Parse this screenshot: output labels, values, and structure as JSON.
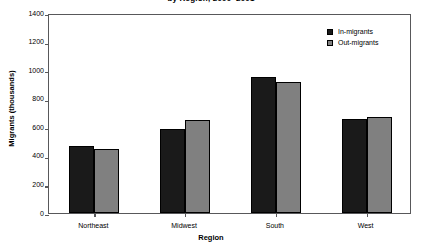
{
  "chart_data": {
    "type": "bar",
    "title": "by Region, 2000–2001",
    "xlabel": "Region",
    "ylabel": "Migrants (thousands)",
    "categories": [
      "Northeast",
      "Midwest",
      "South",
      "West"
    ],
    "series": [
      {
        "name": "In-migrants",
        "color": "#1a1a1a",
        "values": [
          470,
          590,
          950,
          660
        ]
      },
      {
        "name": "Out-migrants",
        "color": "#808080",
        "values": [
          450,
          650,
          915,
          675
        ]
      }
    ],
    "ylim": [
      0,
      1400
    ],
    "ytick_step": 200,
    "yticks": [
      0,
      200,
      400,
      600,
      800,
      1000,
      1200,
      1400
    ],
    "ytick_labels": [
      "0",
      "200",
      "400",
      "600",
      "800",
      "1000",
      "1200",
      "1400"
    ],
    "grid": false,
    "legend_position": "top-right",
    "frame_color": "#58585a"
  }
}
